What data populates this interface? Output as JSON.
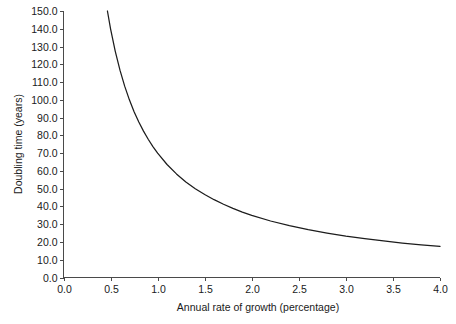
{
  "chart_data": {
    "type": "line",
    "title": "",
    "xlabel": "Annual rate of growth (percentage)",
    "ylabel": "Doubling time (years)",
    "xlim": [
      0.0,
      4.0
    ],
    "ylim": [
      0.0,
      150.0
    ],
    "grid": false,
    "legend": null,
    "formula": "doubling time = 70 / annual rate of growth",
    "xticks": [
      "0.0",
      "0.5",
      "1.0",
      "1.5",
      "2.0",
      "2.5",
      "3.0",
      "3.5",
      "4.0"
    ],
    "xtick_values": [
      0.0,
      0.5,
      1.0,
      1.5,
      2.0,
      2.5,
      3.0,
      3.5,
      4.0
    ],
    "yticks": [
      "0.0",
      "10.0",
      "20.0",
      "30.0",
      "40.0",
      "50.0",
      "60.0",
      "70.0",
      "80.0",
      "90.0",
      "100.0",
      "110.0",
      "120.0",
      "130.0",
      "140.0",
      "150.0"
    ],
    "ytick_values": [
      0,
      10,
      20,
      30,
      40,
      50,
      60,
      70,
      80,
      90,
      100,
      110,
      120,
      130,
      140,
      150
    ],
    "series": [
      {
        "name": "Doubling time",
        "color": "#1c1c1c",
        "x": [
          0.4667,
          0.5,
          0.55,
          0.6,
          0.65,
          0.7,
          0.75,
          0.8,
          0.85,
          0.9,
          0.95,
          1.0,
          1.1,
          1.2,
          1.3,
          1.4,
          1.5,
          1.6,
          1.7,
          1.8,
          1.9,
          2.0,
          2.2,
          2.4,
          2.6,
          2.8,
          3.0,
          3.2,
          3.4,
          3.6,
          3.8,
          4.0
        ],
        "values": [
          150.0,
          140.0,
          127.3,
          116.7,
          107.7,
          100.0,
          93.3,
          87.5,
          82.4,
          77.8,
          73.7,
          70.0,
          63.6,
          58.3,
          53.8,
          50.0,
          46.7,
          43.8,
          41.2,
          38.9,
          36.8,
          35.0,
          31.8,
          29.2,
          26.9,
          25.0,
          23.3,
          21.9,
          20.6,
          19.4,
          18.4,
          17.5
        ]
      }
    ]
  },
  "axes": {
    "x_title": "Annual rate of growth (percentage)",
    "y_title": "Doubling time (years)"
  }
}
